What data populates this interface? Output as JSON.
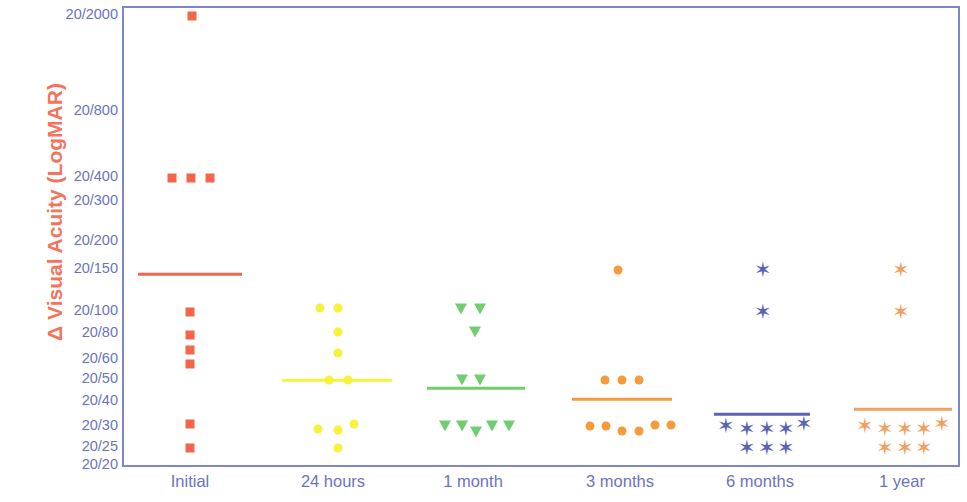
{
  "chart_data": {
    "type": "scatter",
    "title": "",
    "subtitle": "",
    "xlabel": "",
    "ylabel": "Δ Visual Acuity (LogMAR)",
    "grid": false,
    "legend": "none",
    "y_axis": {
      "scale": "logMAR (Snellen notation)",
      "tick_labels": [
        "20/2000",
        "20/800",
        "20/400",
        "20/300",
        "20/200",
        "20/150",
        "20/100",
        "20/80",
        "20/60",
        "20/50",
        "20/40",
        "20/30",
        "20/25",
        "20/20"
      ],
      "tick_logmar": [
        2.0,
        1.602,
        1.301,
        1.176,
        1.0,
        0.875,
        0.699,
        0.602,
        0.477,
        0.398,
        0.301,
        0.176,
        0.097,
        0.0
      ],
      "tick_pixel_y": [
        14,
        110,
        176,
        200,
        240,
        268,
        310,
        332,
        358,
        378,
        400,
        425,
        446,
        464
      ],
      "ylim_top_label": "20/2000",
      "ylim_bottom_label": "20/20"
    },
    "categories": [
      "Initial",
      "24 hours",
      "1 month",
      "3 months",
      "6 months",
      "1 year"
    ],
    "category_pixel_x": [
      190,
      333,
      473,
      620,
      760,
      902
    ],
    "series": [
      {
        "name": "Initial",
        "marker": "square",
        "color": "#F4654B",
        "median_label": "20/150",
        "median_y": 272,
        "median_x_start": 136,
        "median_x_end": 240,
        "points": [
          {
            "label": "20/2000",
            "x": 190,
            "y": 14
          },
          {
            "label": "20/400",
            "x": 170,
            "y": 176
          },
          {
            "label": "20/400",
            "x": 189,
            "y": 176
          },
          {
            "label": "20/400",
            "x": 208,
            "y": 176
          },
          {
            "label": "20/100",
            "x": 188,
            "y": 310
          },
          {
            "label": "20/80",
            "x": 188,
            "y": 333
          },
          {
            "label": "20/60",
            "x": 188,
            "y": 348
          },
          {
            "label": "20/50",
            "x": 188,
            "y": 362
          },
          {
            "label": "20/30",
            "x": 188,
            "y": 422
          },
          {
            "label": "20/25",
            "x": 188,
            "y": 446
          }
        ]
      },
      {
        "name": "24 hours",
        "marker": "circle",
        "color": "#F7F13C",
        "median_label": "20/50",
        "median_y": 378,
        "median_x_start": 280,
        "median_x_end": 390,
        "points": [
          {
            "label": "20/100",
            "x": 318,
            "y": 306
          },
          {
            "label": "20/100",
            "x": 336,
            "y": 306
          },
          {
            "label": "20/80",
            "x": 336,
            "y": 330
          },
          {
            "label": "20/60",
            "x": 336,
            "y": 351
          },
          {
            "label": "20/50",
            "x": 327,
            "y": 378
          },
          {
            "label": "20/50",
            "x": 346,
            "y": 378
          },
          {
            "label": "20/30",
            "x": 316,
            "y": 427
          },
          {
            "label": "20/30",
            "x": 336,
            "y": 428
          },
          {
            "label": "20/30",
            "x": 352,
            "y": 422
          },
          {
            "label": "20/25",
            "x": 336,
            "y": 446
          }
        ]
      },
      {
        "name": "1 month",
        "marker": "triangle-down",
        "color": "#71CE70",
        "median_label": "20/50",
        "median_y": 386,
        "median_x_start": 425,
        "median_x_end": 523,
        "points": [
          {
            "label": "20/100",
            "x": 459,
            "y": 307
          },
          {
            "label": "20/100",
            "x": 478,
            "y": 307
          },
          {
            "label": "20/80",
            "x": 473,
            "y": 330
          },
          {
            "label": "20/50",
            "x": 460,
            "y": 378
          },
          {
            "label": "20/50",
            "x": 478,
            "y": 378
          },
          {
            "label": "20/30",
            "x": 443,
            "y": 424
          },
          {
            "label": "20/30",
            "x": 460,
            "y": 424
          },
          {
            "label": "20/30",
            "x": 474,
            "y": 430
          },
          {
            "label": "20/30",
            "x": 490,
            "y": 424
          },
          {
            "label": "20/30",
            "x": 507,
            "y": 424
          }
        ]
      },
      {
        "name": "3 months",
        "marker": "circle",
        "color": "#F79A3C",
        "median_label": "20/40",
        "median_y": 397,
        "median_x_start": 570,
        "median_x_end": 670,
        "points": [
          {
            "label": "20/150",
            "x": 616,
            "y": 268
          },
          {
            "label": "20/50",
            "x": 603,
            "y": 378
          },
          {
            "label": "20/50",
            "x": 620,
            "y": 378
          },
          {
            "label": "20/50",
            "x": 637,
            "y": 378
          },
          {
            "label": "20/30",
            "x": 588,
            "y": 424
          },
          {
            "label": "20/30",
            "x": 604,
            "y": 424
          },
          {
            "label": "20/25",
            "x": 620,
            "y": 429
          },
          {
            "label": "20/25",
            "x": 637,
            "y": 429
          },
          {
            "label": "20/30",
            "x": 653,
            "y": 423
          },
          {
            "label": "20/30",
            "x": 669,
            "y": 423
          }
        ]
      },
      {
        "name": "6 months",
        "marker": "asterisk",
        "color": "#5C62B8",
        "median_label": "20/40",
        "median_y": 412,
        "median_x_start": 712,
        "median_x_end": 808,
        "points": [
          {
            "label": "20/150",
            "x": 760,
            "y": 268
          },
          {
            "label": "20/100",
            "x": 760,
            "y": 310
          },
          {
            "label": "20/30",
            "x": 723,
            "y": 424
          },
          {
            "label": "20/30",
            "x": 744,
            "y": 427
          },
          {
            "label": "20/30",
            "x": 764,
            "y": 427
          },
          {
            "label": "20/30",
            "x": 783,
            "y": 427
          },
          {
            "label": "20/30",
            "x": 801,
            "y": 422
          },
          {
            "label": "20/25",
            "x": 744,
            "y": 446
          },
          {
            "label": "20/25",
            "x": 764,
            "y": 446
          },
          {
            "label": "20/25",
            "x": 783,
            "y": 446
          }
        ]
      },
      {
        "name": "1 year",
        "marker": "asterisk",
        "color": "#F0A060",
        "median_label": "20/40",
        "median_y": 407,
        "median_x_start": 852,
        "median_x_end": 950,
        "points": [
          {
            "label": "20/150",
            "x": 898,
            "y": 268
          },
          {
            "label": "20/100",
            "x": 898,
            "y": 310
          },
          {
            "label": "20/30",
            "x": 862,
            "y": 424
          },
          {
            "label": "20/30",
            "x": 882,
            "y": 427
          },
          {
            "label": "20/30",
            "x": 902,
            "y": 427
          },
          {
            "label": "20/30",
            "x": 921,
            "y": 427
          },
          {
            "label": "20/30",
            "x": 939,
            "y": 422
          },
          {
            "label": "20/25",
            "x": 882,
            "y": 446
          },
          {
            "label": "20/25",
            "x": 902,
            "y": 446
          },
          {
            "label": "20/25",
            "x": 921,
            "y": 446
          }
        ]
      }
    ]
  },
  "colors": {
    "axis_border": "#7C86C8",
    "tick_text": "#6A74BE",
    "ylabel_text": "#F4735B",
    "background": "#FFFFFF"
  }
}
